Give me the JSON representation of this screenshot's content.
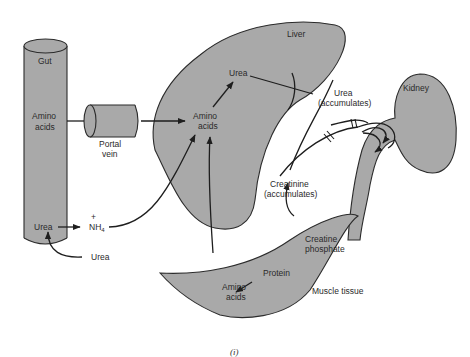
{
  "diagram": {
    "organs": {
      "gut": "Gut",
      "liver": "Liver",
      "kidney": "Kidney",
      "muscle": "Muscle tissue",
      "portal_vein": [
        "Portal",
        "vein"
      ]
    },
    "labels": {
      "gut_amino": [
        "Amino",
        "acids"
      ],
      "gut_urea": "Urea",
      "ext_urea": "Urea",
      "nh4": "NH",
      "nh4_sub": "4",
      "nh4_plus": "+",
      "liver_urea": "Urea",
      "liver_amino": [
        "Amino",
        "acids"
      ],
      "urea_accum": [
        "Urea",
        "(accumulates)"
      ],
      "creatinine_accum": [
        "Creatinine",
        "(accumulates)"
      ],
      "creatine_phosphate": [
        "Creatine",
        "phosphate"
      ],
      "protein": "Protein",
      "muscle_amino": [
        "Amino",
        "acids"
      ]
    },
    "caption": "(i)",
    "colors": {
      "organ_fill": "#a9a9a9",
      "outline": "#2b2b2b",
      "text": "#2a2a2a"
    }
  }
}
